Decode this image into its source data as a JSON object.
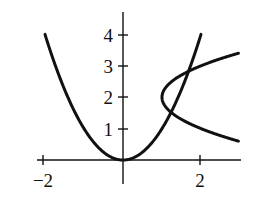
{
  "chart_data": {
    "type": "line",
    "title": "",
    "xlabel": "",
    "ylabel": "",
    "xlim": [
      -2.1,
      3.0
    ],
    "ylim": [
      -0.3,
      4.7
    ],
    "grid": false,
    "legend": null,
    "x_ticks": [
      -2,
      0,
      2
    ],
    "x_tick_labels": [
      "−2",
      "",
      "2"
    ],
    "y_ticks": [
      1,
      2,
      3,
      4
    ],
    "y_tick_labels": [
      "1",
      "2",
      "3",
      "4"
    ],
    "series": [
      {
        "name": "y = x^2",
        "equation": "y = x^2",
        "x": [
          -2,
          -1.5,
          -1,
          -0.5,
          0,
          0.5,
          1,
          1.5,
          2
        ],
        "y": [
          4,
          2.25,
          1,
          0.25,
          0,
          0.25,
          1,
          2.25,
          4
        ]
      },
      {
        "name": "x = (y - 2)^2 + 1",
        "equation": "x = (y - 2)^2 + 1",
        "x": [
          2.96,
          2.44,
          2.0,
          1.64,
          1.36,
          1.16,
          1.04,
          1.0,
          1.04,
          1.16,
          1.36,
          1.64,
          2.0,
          2.44,
          2.96
        ],
        "y": [
          0.6,
          0.8,
          1.0,
          1.2,
          1.4,
          1.6,
          1.8,
          2.0,
          2.2,
          2.4,
          2.6,
          2.8,
          3.0,
          3.2,
          3.4
        ]
      }
    ],
    "annotations": [],
    "intersections_approx": [
      [
        1.25,
        1.56
      ],
      [
        1.75,
        3.06
      ]
    ]
  }
}
